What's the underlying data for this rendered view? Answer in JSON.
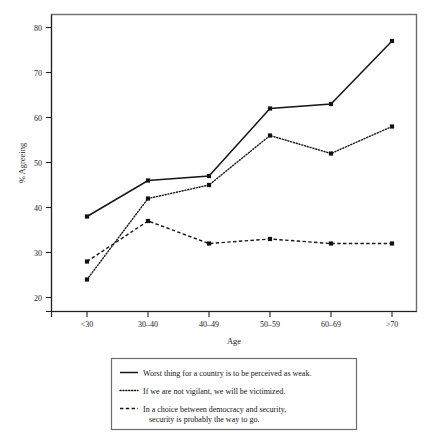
{
  "chart_data": {
    "type": "line",
    "title": "",
    "xlabel": "Age",
    "ylabel": "% Agreeing",
    "categories": [
      "<30",
      "30–40",
      "40–49",
      "50–59",
      "60–69",
      ">70"
    ],
    "ylim": [
      17,
      83
    ],
    "yticks": [
      20,
      30,
      40,
      50,
      60,
      70,
      80
    ],
    "ytick_labels": [
      "20",
      "30",
      "40",
      "50",
      "60",
      "70",
      "80"
    ],
    "grid": false,
    "legend_position": "below-plot",
    "series": [
      {
        "name": "Worst thing for a country is to be perceived as weak.",
        "style": "solid",
        "values": [
          38,
          46,
          47,
          62,
          63,
          77
        ]
      },
      {
        "name": "If we are not vigilant, we will be victimized.",
        "style": "dotted",
        "values": [
          24,
          42,
          45,
          56,
          52,
          58
        ]
      },
      {
        "name": "In a choice between democracy and security, security is probably the way to go.",
        "style": "dashed",
        "values": [
          28,
          37,
          32,
          33,
          32,
          32
        ]
      }
    ]
  },
  "axes": {
    "x_title": "Age",
    "y_title": "% Agreeing",
    "x_tick_labels": [
      "<30",
      "30–40",
      "40–49",
      "50–59",
      "60–69",
      ">70"
    ],
    "y_tick_labels": [
      "80",
      "70",
      "60",
      "50",
      "40",
      "30",
      "20"
    ]
  },
  "legend": {
    "entries": [
      {
        "marker": "solid-line-swatch",
        "line1": "Worst thing for a country is to be perceived as weak.",
        "line2": ""
      },
      {
        "marker": "dotted-line-swatch",
        "line1": "If we are not vigilant, we will be victimized.",
        "line2": ""
      },
      {
        "marker": "dashed-line-swatch",
        "line1": "In a choice between democracy and security,",
        "line2": "security is probably the way to go."
      }
    ]
  },
  "colors": {
    "line": "#161616",
    "frame": "#6d6d6d",
    "text": "#141414",
    "background": "#ffffff"
  }
}
